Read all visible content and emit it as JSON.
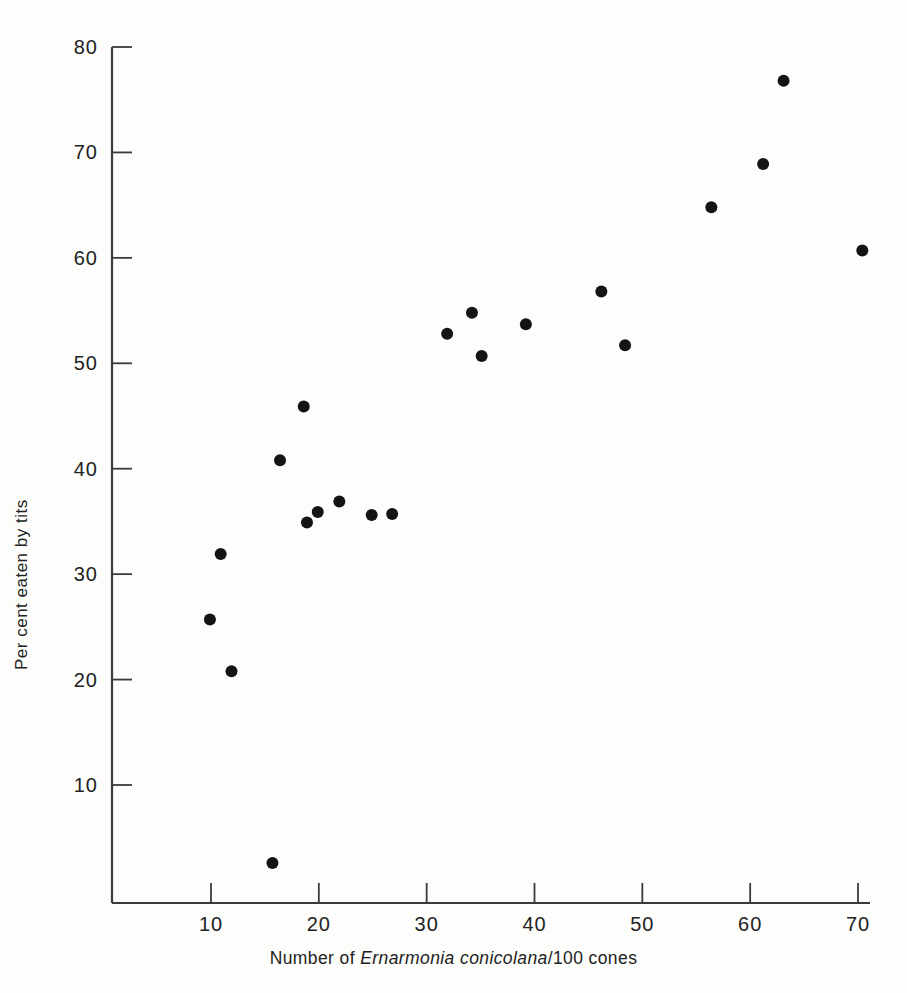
{
  "figure": {
    "background_color": "#fdfdfc",
    "ink_color": "#141414",
    "axis_color": "#3b3b3b"
  },
  "labels": {
    "xlabel_prefix": "Number of ",
    "xlabel_species": "Ernarmonia conicolana",
    "xlabel_suffix": "/100 cones",
    "ylabel": "Per cent eaten by tits"
  },
  "chart_data": {
    "type": "scatter",
    "title": "",
    "xlabel": "Number of Ernarmonia conicolana/100 cones",
    "ylabel": "Per cent eaten by tits",
    "xlim": [
      0,
      73
    ],
    "ylim": [
      0,
      82
    ],
    "xticks": [
      10,
      20,
      30,
      40,
      50,
      60,
      70
    ],
    "xticklabels": [
      "10",
      "20",
      "30",
      "40",
      "50",
      "60",
      "70"
    ],
    "yticks": [
      10,
      20,
      30,
      40,
      50,
      60,
      70,
      80
    ],
    "yticklabels": [
      "10",
      "20",
      "30",
      "40",
      "50",
      "60",
      "70",
      "80"
    ],
    "grid": false,
    "legend": null,
    "marker": "filled-circle",
    "marker_size": 11,
    "points": [
      {
        "x": 9.9,
        "y": 25.7
      },
      {
        "x": 10.9,
        "y": 31.9
      },
      {
        "x": 11.9,
        "y": 20.8
      },
      {
        "x": 15.7,
        "y": 2.6
      },
      {
        "x": 16.4,
        "y": 40.8
      },
      {
        "x": 18.6,
        "y": 45.9
      },
      {
        "x": 18.9,
        "y": 34.9
      },
      {
        "x": 19.9,
        "y": 35.9
      },
      {
        "x": 21.9,
        "y": 36.9
      },
      {
        "x": 24.9,
        "y": 35.6
      },
      {
        "x": 26.8,
        "y": 35.7
      },
      {
        "x": 31.9,
        "y": 52.8
      },
      {
        "x": 34.2,
        "y": 54.8
      },
      {
        "x": 35.1,
        "y": 50.7
      },
      {
        "x": 39.2,
        "y": 53.7
      },
      {
        "x": 46.2,
        "y": 56.8
      },
      {
        "x": 48.4,
        "y": 51.7
      },
      {
        "x": 56.4,
        "y": 64.8
      },
      {
        "x": 61.2,
        "y": 68.9
      },
      {
        "x": 63.1,
        "y": 76.8
      },
      {
        "x": 70.4,
        "y": 60.7
      }
    ]
  }
}
